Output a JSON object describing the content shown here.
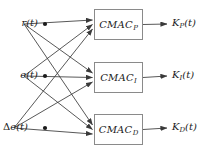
{
  "diagram": {
    "background_color": "#ffffff",
    "line_color": "#3a3a3a",
    "box_border_color": "#8a8a8a",
    "text_color": "#1b1b1b",
    "inputs": [
      {
        "id": "input-r",
        "label_main": "r",
        "label_arg": "(t)",
        "prefix": "",
        "x": 22,
        "y": 24
      },
      {
        "id": "input-e",
        "label_main": "e",
        "label_arg": "(t)",
        "prefix": "",
        "x": 22,
        "y": 76
      },
      {
        "id": "input-de",
        "label_main": "e",
        "label_arg": "(t)",
        "prefix": "Δ",
        "x": 12,
        "y": 128
      }
    ],
    "blocks": [
      {
        "id": "cmac-p",
        "name": "CMAC",
        "subscript": "P",
        "x": 94,
        "y": 9,
        "w": 49,
        "h": 31
      },
      {
        "id": "cmac-i",
        "name": "CMAC",
        "subscript": "I",
        "x": 94,
        "y": 62,
        "w": 49,
        "h": 31
      },
      {
        "id": "cmac-d",
        "name": "CMAC",
        "subscript": "D",
        "x": 94,
        "y": 114,
        "w": 49,
        "h": 31
      }
    ],
    "outputs": [
      {
        "id": "output-kp",
        "name": "K",
        "subscript": "P",
        "arg": "(t)",
        "x": 172,
        "y": 24
      },
      {
        "id": "output-ki",
        "name": "K",
        "subscript": "I",
        "arg": "(t)",
        "x": 172,
        "y": 76
      },
      {
        "id": "output-kd",
        "name": "K",
        "subscript": "D",
        "arg": "(t)",
        "x": 172,
        "y": 128
      }
    ],
    "connections": [
      {
        "from": "input-r",
        "to": "cmac-p"
      },
      {
        "from": "input-r",
        "to": "cmac-i"
      },
      {
        "from": "input-r",
        "to": "cmac-d"
      },
      {
        "from": "input-e",
        "to": "cmac-p"
      },
      {
        "from": "input-e",
        "to": "cmac-i"
      },
      {
        "from": "input-e",
        "to": "cmac-d"
      },
      {
        "from": "input-de",
        "to": "cmac-p"
      },
      {
        "from": "input-de",
        "to": "cmac-i"
      },
      {
        "from": "input-de",
        "to": "cmac-d"
      }
    ],
    "junction_points": [
      {
        "x": 45,
        "y": 24
      },
      {
        "x": 45,
        "y": 76
      },
      {
        "x": 45,
        "y": 128
      }
    ]
  }
}
